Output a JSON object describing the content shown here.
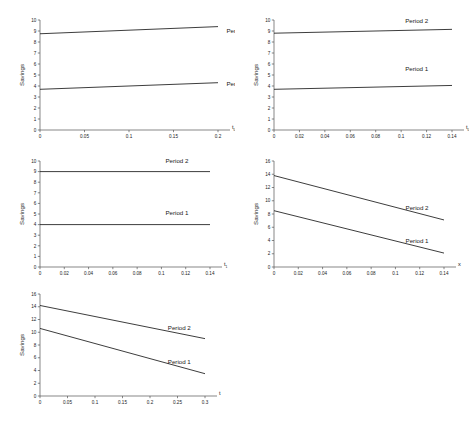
{
  "figure": {
    "caption": "",
    "background": "#ffffff",
    "line_color": "#1a1a1a",
    "axis_color": "#555555",
    "series_names": [
      "Period 1",
      "Period 2"
    ],
    "y_axis_label": "Savings"
  },
  "chart_data": [
    {
      "id": "panel-1",
      "type": "line",
      "title": "",
      "xlabel": "t₀",
      "ylabel": "Savings",
      "xlim": [
        0,
        0.2
      ],
      "ylim": [
        0,
        10
      ],
      "xticks": [
        "0",
        "0.05",
        "0.1",
        "0.15",
        "0.2"
      ],
      "xtick_values": [
        0,
        0.05,
        0.1,
        0.15,
        0.2
      ],
      "yticks": [
        "0",
        "1",
        "2",
        "3",
        "4",
        "5",
        "6",
        "7",
        "8",
        "9",
        "10"
      ],
      "ytick_values": [
        0,
        1,
        2,
        3,
        4,
        5,
        6,
        7,
        8,
        9,
        10
      ],
      "grid": false,
      "legend_position": "inline-right",
      "series": [
        {
          "name": "Period 1",
          "x": [
            0,
            0.2
          ],
          "values": [
            3.7,
            4.3
          ],
          "label_x": 0.205,
          "label_y": 4.0
        },
        {
          "name": "Period 2",
          "x": [
            0,
            0.2
          ],
          "values": [
            8.75,
            9.4
          ],
          "label_x": 0.205,
          "label_y": 8.85
        }
      ]
    },
    {
      "id": "panel-2",
      "type": "line",
      "title": "",
      "xlabel": "t₀",
      "ylabel": "Savings",
      "xlim": [
        0,
        0.14
      ],
      "ylim": [
        0,
        10
      ],
      "xticks": [
        "0",
        "0.02",
        "0.04",
        "0.06",
        "0.08",
        "0.1",
        "0.12",
        "0.14"
      ],
      "xtick_values": [
        0,
        0.02,
        0.04,
        0.06,
        0.08,
        0.1,
        0.12,
        0.14
      ],
      "yticks": [
        "0",
        "1",
        "2",
        "3",
        "4",
        "5",
        "6",
        "7",
        "8",
        "9",
        "10"
      ],
      "ytick_values": [
        0,
        1,
        2,
        3,
        4,
        5,
        6,
        7,
        8,
        9,
        10
      ],
      "grid": false,
      "legend_position": "inline-right",
      "series": [
        {
          "name": "Period 1",
          "x": [
            0,
            0.14
          ],
          "values": [
            3.7,
            4.05
          ],
          "label_x": 0.1,
          "label_y": 5.4
        },
        {
          "name": "Period 2",
          "x": [
            0,
            0.14
          ],
          "values": [
            8.8,
            9.15
          ],
          "label_x": 0.1,
          "label_y": 9.7
        }
      ]
    },
    {
      "id": "panel-3",
      "type": "line",
      "title": "",
      "xlabel": "t₁",
      "ylabel": "Savings",
      "xlim": [
        0,
        0.14
      ],
      "ylim": [
        0,
        10
      ],
      "xticks": [
        "0",
        "0.02",
        "0.04",
        "0.06",
        "0.08",
        "0.1",
        "0.12",
        "0.14"
      ],
      "xtick_values": [
        0,
        0.02,
        0.04,
        0.06,
        0.08,
        0.1,
        0.12,
        0.14
      ],
      "yticks": [
        "0",
        "1",
        "2",
        "3",
        "4",
        "5",
        "6",
        "7",
        "8",
        "9",
        "10"
      ],
      "ytick_values": [
        0,
        1,
        2,
        3,
        4,
        5,
        6,
        7,
        8,
        9,
        10
      ],
      "grid": false,
      "legend_position": "inline-right",
      "series": [
        {
          "name": "Period 1",
          "x": [
            0,
            0.14
          ],
          "values": [
            4.0,
            4.0
          ],
          "label_x": 0.1,
          "label_y": 4.9
        },
        {
          "name": "Period 2",
          "x": [
            0,
            0.14
          ],
          "values": [
            9.0,
            9.0
          ],
          "label_x": 0.1,
          "label_y": 9.85
        }
      ]
    },
    {
      "id": "panel-4",
      "type": "line",
      "title": "",
      "xlabel": "x",
      "ylabel": "Savings",
      "xlim": [
        0,
        0.14
      ],
      "ylim": [
        0,
        16
      ],
      "xticks": [
        "0",
        "0.02",
        "0.04",
        "0.06",
        "0.08",
        "0.1",
        "0.12",
        "0.14"
      ],
      "xtick_values": [
        0,
        0.02,
        0.04,
        0.06,
        0.08,
        0.1,
        0.12,
        0.14
      ],
      "yticks": [
        "0",
        "2",
        "4",
        "6",
        "8",
        "10",
        "12",
        "14",
        "16"
      ],
      "ytick_values": [
        0,
        2,
        4,
        6,
        8,
        10,
        12,
        14,
        16
      ],
      "grid": false,
      "legend_position": "inline-right",
      "series": [
        {
          "name": "Period 1",
          "x": [
            0,
            0.14
          ],
          "values": [
            8.5,
            2.1
          ],
          "label_x": 0.105,
          "label_y": 3.6
        },
        {
          "name": "Period 2",
          "x": [
            0,
            0.14
          ],
          "values": [
            13.8,
            7.1
          ],
          "label_x": 0.105,
          "label_y": 8.6
        }
      ]
    },
    {
      "id": "panel-5",
      "type": "line",
      "title": "",
      "xlabel": "t",
      "ylabel": "Savings",
      "xlim": [
        0,
        0.3
      ],
      "ylim": [
        0,
        16
      ],
      "xticks": [
        "0",
        "0.05",
        "0.1",
        "0.15",
        "0.2",
        "0.25",
        "0.3"
      ],
      "xtick_values": [
        0,
        0.05,
        0.1,
        0.15,
        0.2,
        0.25,
        0.3
      ],
      "yticks": [
        "0",
        "2",
        "4",
        "6",
        "8",
        "10",
        "12",
        "14",
        "16"
      ],
      "ytick_values": [
        0,
        2,
        4,
        6,
        8,
        10,
        12,
        14,
        16
      ],
      "grid": false,
      "legend_position": "inline-right",
      "series": [
        {
          "name": "Period 1",
          "x": [
            0,
            0.3
          ],
          "values": [
            10.6,
            3.5
          ],
          "label_x": 0.225,
          "label_y": 5.0
        },
        {
          "name": "Period 2",
          "x": [
            0,
            0.3
          ],
          "values": [
            14.2,
            9.0
          ],
          "label_x": 0.225,
          "label_y": 10.3
        }
      ]
    }
  ]
}
